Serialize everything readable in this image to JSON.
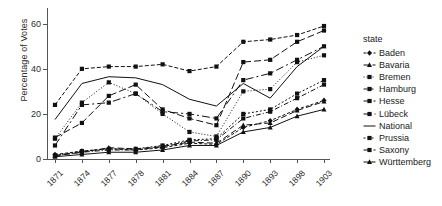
{
  "chart_data": {
    "type": "line",
    "title": "",
    "xlabel": "",
    "ylabel": "Percentage of Votes",
    "x": [
      "1871",
      "1874",
      "1877",
      "1878",
      "1881",
      "1884",
      "1887",
      "1890",
      "1893",
      "1898",
      "1903"
    ],
    "xticklabels": [
      "1871",
      "1874",
      "1877",
      "1878",
      "1881",
      "1884",
      "1887",
      "1890",
      "1893",
      "1898",
      "1903"
    ],
    "yticklabels": [
      "0",
      "20",
      "40",
      "60"
    ],
    "yticks": [
      0,
      20,
      40,
      60
    ],
    "ylim": [
      0,
      63
    ],
    "grid": false,
    "legend_position": "right",
    "legend_title": "state",
    "series": [
      {
        "name": "Baden",
        "marker": "diamond",
        "dash": "3,2",
        "values": [
          2.0,
          3.5,
          4.5,
          4.0,
          5.0,
          7.0,
          6.5,
          14.0,
          17.0,
          22.0,
          26.0
        ]
      },
      {
        "name": "Bavaria",
        "marker": "triangle",
        "dash": "6,3",
        "values": [
          1.5,
          3.0,
          5.0,
          4.5,
          5.5,
          7.5,
          7.0,
          15.0,
          16.0,
          21.5,
          25.5
        ]
      },
      {
        "name": "Bremen",
        "marker": "square",
        "dash": "1,2",
        "values": [
          9.0,
          25.0,
          34.0,
          29.0,
          20.0,
          12.0,
          10.0,
          30.0,
          31.0,
          43.0,
          46.0
        ]
      },
      {
        "name": "Hamburg",
        "marker": "square",
        "dash": "4,2",
        "values": [
          24.0,
          40.0,
          41.0,
          41.0,
          42.0,
          39.0,
          41.0,
          52.0,
          53.0,
          55.0,
          59.0
        ]
      },
      {
        "name": "Hesse",
        "marker": "square",
        "dash": "5,2,1,2",
        "values": [
          1.5,
          3.0,
          4.0,
          4.0,
          5.5,
          8.0,
          8.5,
          18.0,
          21.0,
          27.0,
          33.0
        ]
      },
      {
        "name": "Lübeck",
        "marker": "square",
        "dash": "8,3,2,3",
        "values": [
          6.0,
          24.0,
          25.0,
          29.0,
          21.0,
          20.0,
          18.0,
          35.0,
          38.0,
          44.0,
          50.0
        ]
      },
      {
        "name": "National",
        "marker": "none",
        "dash": "0",
        "values": [
          17.5,
          33.5,
          36.5,
          36.0,
          33.0,
          26.5,
          23.5,
          33.5,
          27.0,
          41.0,
          50.0
        ]
      },
      {
        "name": "Prussia",
        "marker": "square",
        "dash": "2,2",
        "values": [
          1.5,
          3.5,
          4.5,
          4.5,
          6.0,
          8.5,
          9.0,
          20.0,
          22.0,
          29.0,
          35.0
        ]
      },
      {
        "name": "Saxony",
        "marker": "square",
        "dash": "7,3",
        "values": [
          9.5,
          16.0,
          28.0,
          33.0,
          22.0,
          18.0,
          15.0,
          43.0,
          44.0,
          52.0,
          57.0
        ]
      },
      {
        "name": "Württemberg",
        "marker": "triangle",
        "dash": "0",
        "values": [
          1.0,
          2.0,
          3.0,
          3.0,
          4.0,
          6.0,
          6.0,
          12.0,
          14.0,
          19.0,
          22.0
        ]
      }
    ]
  },
  "legend": {
    "title": "state",
    "items": [
      {
        "label": "Baden"
      },
      {
        "label": "Bavaria"
      },
      {
        "label": "Bremen"
      },
      {
        "label": "Hamburg"
      },
      {
        "label": "Hesse"
      },
      {
        "label": "Lübeck"
      },
      {
        "label": "National"
      },
      {
        "label": "Prussia"
      },
      {
        "label": "Saxony"
      },
      {
        "label": "Württemberg"
      }
    ]
  }
}
